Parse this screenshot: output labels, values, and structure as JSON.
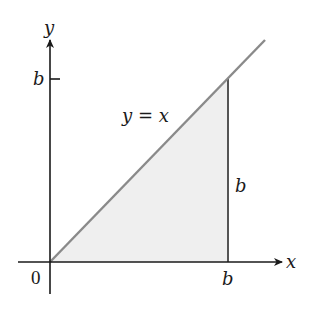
{
  "figure": {
    "axes": {
      "x_label": "x",
      "y_label": "y",
      "origin_label": "0"
    },
    "ticks": {
      "x_tick_label": "b",
      "y_tick_label": "b"
    },
    "line": {
      "equation_label": "y = x",
      "color": "#8a8a8a"
    },
    "region": {
      "description": "Shaded right triangle under y = x from x = 0 to x = b",
      "fill_color": "#efefef",
      "side_label": "b"
    },
    "colors": {
      "axis": "#1a1a1a",
      "vertical_edge": "#555555"
    }
  }
}
